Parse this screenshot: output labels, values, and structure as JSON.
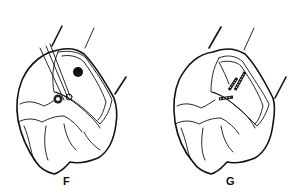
{
  "figure": {
    "panels": [
      {
        "id": "F",
        "label": "F",
        "description": "Tooth with instrument inserting pins into prepared cavity"
      },
      {
        "id": "G",
        "label": "G",
        "description": "Tooth with pins placed in prepared cavity"
      }
    ],
    "colors": {
      "ink": "#111111",
      "background": "#ffffff"
    }
  }
}
